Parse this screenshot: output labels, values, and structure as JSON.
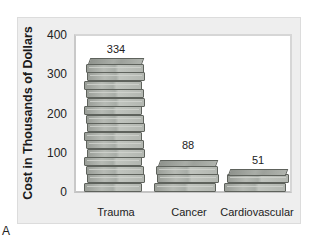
{
  "chart_data": {
    "type": "bar",
    "title": "",
    "xlabel": "",
    "ylabel": "Cost in Thousands of Dollars",
    "categories": [
      "Trauma",
      "Cancer",
      "Cardiovascular"
    ],
    "values": [
      334,
      88,
      51
    ],
    "data_labels": [
      "334",
      "88",
      "51"
    ],
    "yticks": [
      0,
      100,
      200,
      300,
      400
    ],
    "ylim": [
      0,
      400
    ],
    "grid": false,
    "legend": null,
    "bar_style": "stacks of banknotes (pictograph)"
  },
  "axis": {
    "ylabel": "Cost in Thousands of Dollars",
    "yticks": [
      "400",
      "300",
      "200",
      "100",
      "0"
    ]
  },
  "bars": [
    {
      "label": "Trauma",
      "value": 334,
      "value_label": "334"
    },
    {
      "label": "Cancer",
      "value": 88,
      "value_label": "88"
    },
    {
      "label": "Cardiovascular",
      "value": 51,
      "value_label": "51"
    }
  ],
  "caption": "A",
  "colors": {
    "panel_bg": "#eeeeee",
    "plot_bg": "#ffffff",
    "bill_fill": "#b3b7b1",
    "bill_edge": "#5e625c"
  }
}
